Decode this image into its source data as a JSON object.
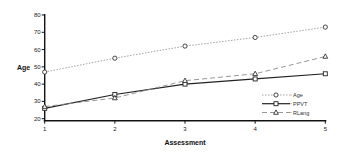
{
  "chart_data": {
    "type": "line",
    "title": "",
    "xlabel": "Assessment",
    "ylabel": "Age",
    "x": [
      1,
      2,
      3,
      4,
      5
    ],
    "x_ticks": [
      "1",
      "2",
      "3",
      "4",
      "5"
    ],
    "y_ticks": [
      "20",
      "30",
      "40",
      "50",
      "60",
      "70",
      "80"
    ],
    "ylim": [
      20,
      80
    ],
    "grid": false,
    "legend_position": "lower right",
    "series": [
      {
        "name": "Age",
        "values": [
          47,
          55,
          62,
          67,
          73
        ],
        "marker": "circle",
        "line": "dotted",
        "color": "#9a9a9a"
      },
      {
        "name": "PPVT",
        "values": [
          26,
          34,
          40,
          43,
          46
        ],
        "marker": "square",
        "line": "solid",
        "color": "#222222"
      },
      {
        "name": "RLang",
        "values": [
          27,
          32,
          42,
          46,
          56
        ],
        "marker": "triangle",
        "line": "dashed",
        "color": "#8a8a8a"
      }
    ]
  }
}
